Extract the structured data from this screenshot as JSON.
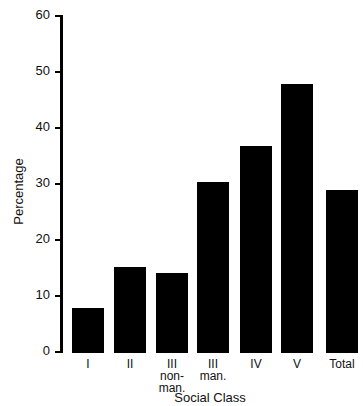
{
  "chart_data": {
    "type": "bar",
    "title": "",
    "xlabel": "Social Class",
    "ylabel": "Percentage",
    "ylim": [
      0,
      60
    ],
    "yticks": [
      0,
      10,
      20,
      30,
      40,
      50,
      60
    ],
    "grid": false,
    "legend": null,
    "categories": [
      "I",
      "II",
      "III\nnon-\nman.",
      "III\nman.",
      "IV",
      "V",
      "Total"
    ],
    "values": [
      8.1,
      15.4,
      14.3,
      30.5,
      37.0,
      48.0,
      29.1
    ],
    "bar_color": "#000000"
  }
}
